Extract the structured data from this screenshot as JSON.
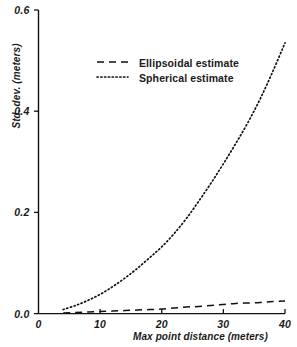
{
  "chart_data": {
    "type": "line",
    "title": "",
    "xlabel": "Max point distance (meters)",
    "ylabel": "Std. dev. (meters)",
    "xlim": [
      0,
      40
    ],
    "ylim": [
      0.0,
      0.6
    ],
    "xticks": [
      "0",
      "10",
      "20",
      "30",
      "40"
    ],
    "xtick_values": [
      0,
      10,
      20,
      30,
      40
    ],
    "yticks": [
      "0.0",
      "0.2",
      "0.4",
      "0.6"
    ],
    "ytick_values": [
      0.0,
      0.2,
      0.4,
      0.6
    ],
    "grid": false,
    "legend_position": "upper center",
    "series": [
      {
        "name": "Ellipsoidal estimate",
        "style": "dashed",
        "x": [
          4,
          6,
          8,
          10,
          12,
          14,
          16,
          18,
          20,
          22,
          24,
          26,
          28,
          30,
          32,
          34,
          36,
          38,
          40
        ],
        "values": [
          0.001,
          0.002,
          0.003,
          0.004,
          0.005,
          0.006,
          0.007,
          0.008,
          0.009,
          0.011,
          0.013,
          0.014,
          0.016,
          0.018,
          0.02,
          0.021,
          0.022,
          0.024,
          0.025
        ]
      },
      {
        "name": "Spherical estimate",
        "style": "dotted",
        "x": [
          4,
          6,
          8,
          10,
          12,
          14,
          16,
          18,
          20,
          22,
          24,
          26,
          28,
          30,
          32,
          34,
          36,
          38,
          40
        ],
        "values": [
          0.008,
          0.016,
          0.026,
          0.038,
          0.053,
          0.07,
          0.089,
          0.11,
          0.132,
          0.158,
          0.188,
          0.222,
          0.258,
          0.296,
          0.336,
          0.378,
          0.425,
          0.478,
          0.535
        ]
      }
    ]
  },
  "legend": {
    "entries": [
      {
        "label": "Ellipsoidal estimate",
        "style": "dashed"
      },
      {
        "label": "Spherical estimate",
        "style": "dotted"
      }
    ]
  },
  "axes": {
    "x_title": "Max point distance (meters)",
    "y_title": "Std. dev. (meters)"
  },
  "colors": {
    "ink": "#111111",
    "background": "#ffffff"
  }
}
